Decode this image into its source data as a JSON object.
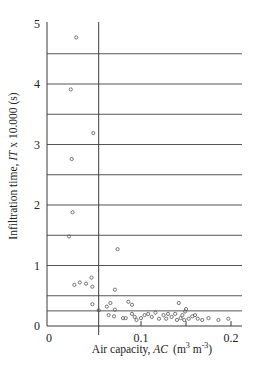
{
  "chart_data": {
    "type": "scatter",
    "title": "",
    "xlabel": "Air capacity, AC (m3 m-3)",
    "xlabel_parts": {
      "prefix": "Air capacity, ",
      "italic": "AC",
      "units_open": "(m",
      "sup1": "3",
      "mid": " m",
      "sup2": "-3",
      "units_close": ")"
    },
    "ylabel": "Infiltration time, IT x 10.000 (s)",
    "ylabel_parts": {
      "prefix": "Infiltration time, ",
      "italic": "IT",
      "suffix": " x 10.000  (s)"
    },
    "xlim": [
      0,
      0.21
    ],
    "ylim": [
      0,
      5
    ],
    "x_ticks": [
      {
        "value": 0,
        "label": "0"
      },
      {
        "value": 0.1,
        "label": "0.1"
      },
      {
        "value": 0.2,
        "label": "0.2"
      }
    ],
    "x_minor_ticks": [
      0.15
    ],
    "y_ticks": [
      {
        "value": 0,
        "label": "0"
      },
      {
        "value": 1,
        "label": "1"
      },
      {
        "value": 2,
        "label": "2"
      },
      {
        "value": 3,
        "label": "3"
      },
      {
        "value": 4,
        "label": "4"
      },
      {
        "value": 5,
        "label": "5"
      }
    ],
    "horizontal_gridlines": [
      0.25,
      0.5,
      1.0,
      1.5,
      2.0,
      2.5,
      3.0,
      3.5,
      4.0,
      4.5
    ],
    "vertical_reference_line": 0.053,
    "marker": "open-circle",
    "series": [
      {
        "name": "observations",
        "points": [
          [
            0.028,
            4.77
          ],
          [
            0.022,
            3.91
          ],
          [
            0.047,
            3.19
          ],
          [
            0.023,
            2.76
          ],
          [
            0.024,
            1.88
          ],
          [
            0.02,
            1.48
          ],
          [
            0.074,
            1.27
          ],
          [
            0.026,
            0.68
          ],
          [
            0.032,
            0.72
          ],
          [
            0.039,
            0.7
          ],
          [
            0.045,
            0.8
          ],
          [
            0.046,
            0.65
          ],
          [
            0.071,
            0.6
          ],
          [
            0.046,
            0.36
          ],
          [
            0.053,
            0.26
          ],
          [
            0.062,
            0.32
          ],
          [
            0.066,
            0.38
          ],
          [
            0.071,
            0.27
          ],
          [
            0.064,
            0.18
          ],
          [
            0.07,
            0.16
          ],
          [
            0.08,
            0.13
          ],
          [
            0.083,
            0.13
          ],
          [
            0.086,
            0.4
          ],
          [
            0.09,
            0.35
          ],
          [
            0.09,
            0.2
          ],
          [
            0.093,
            0.15
          ],
          [
            0.095,
            0.1
          ],
          [
            0.1,
            0.13
          ],
          [
            0.104,
            0.18
          ],
          [
            0.108,
            0.2
          ],
          [
            0.112,
            0.15
          ],
          [
            0.116,
            0.22
          ],
          [
            0.12,
            0.12
          ],
          [
            0.125,
            0.18
          ],
          [
            0.128,
            0.12
          ],
          [
            0.13,
            0.2
          ],
          [
            0.134,
            0.15
          ],
          [
            0.138,
            0.2
          ],
          [
            0.14,
            0.1
          ],
          [
            0.142,
            0.38
          ],
          [
            0.144,
            0.13
          ],
          [
            0.146,
            0.18
          ],
          [
            0.148,
            0.1
          ],
          [
            0.149,
            0.24
          ],
          [
            0.15,
            0.28
          ],
          [
            0.153,
            0.12
          ],
          [
            0.157,
            0.16
          ],
          [
            0.16,
            0.18
          ],
          [
            0.163,
            0.12
          ],
          [
            0.168,
            0.1
          ],
          [
            0.175,
            0.13
          ],
          [
            0.186,
            0.1
          ],
          [
            0.197,
            0.12
          ]
        ]
      }
    ]
  }
}
